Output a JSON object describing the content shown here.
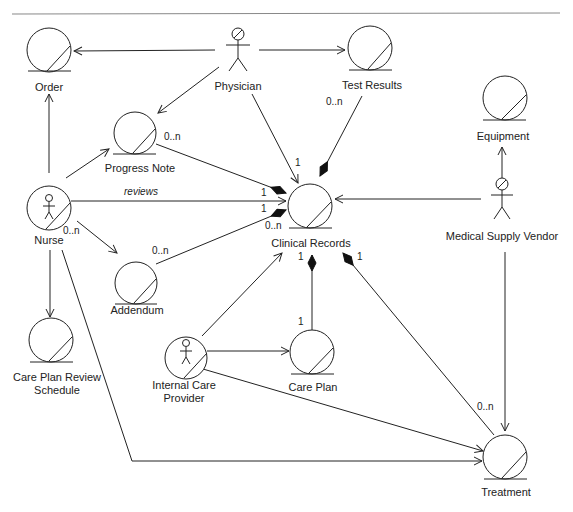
{
  "diagram": {
    "type": "UML entity/boundary collaboration diagram",
    "colors": {
      "stroke": "#222222",
      "background": "#ffffff",
      "fill_diamond": "#111111"
    },
    "nodes": {
      "order": {
        "label": "Order",
        "kind": "entity"
      },
      "physician": {
        "label": "Physician",
        "kind": "actor"
      },
      "test_results": {
        "label": "Test Results",
        "kind": "entity"
      },
      "progress_note": {
        "label": "Progress Note",
        "kind": "entity"
      },
      "equipment": {
        "label": "Equipment",
        "kind": "entity"
      },
      "nurse": {
        "label": "Nurse",
        "kind": "actor-entity"
      },
      "clinical_records": {
        "label": "Clinical Records",
        "kind": "entity"
      },
      "medical_supply_vendor": {
        "label": "Medical Supply Vendor",
        "kind": "actor"
      },
      "addendum": {
        "label": "Addendum",
        "kind": "entity"
      },
      "care_plan_review_schedule": {
        "label": "Care Plan Review\nSchedule",
        "kind": "entity"
      },
      "internal_care_provider": {
        "label": "Internal Care\nProvider",
        "kind": "actor-entity"
      },
      "care_plan": {
        "label": "Care Plan",
        "kind": "entity"
      },
      "treatment": {
        "label": "Treatment",
        "kind": "entity"
      }
    },
    "edges": [
      {
        "from": "Physician",
        "to": "Order",
        "type": "navigable association"
      },
      {
        "from": "Physician",
        "to": "Test Results",
        "type": "navigable association"
      },
      {
        "from": "Physician",
        "to": "Progress Note",
        "type": "navigable association"
      },
      {
        "from": "Physician",
        "to": "Clinical Records",
        "type": "navigable association",
        "mult_to": "1"
      },
      {
        "from": "Test Results",
        "to": "Clinical Records",
        "type": "composition",
        "mult_from": "0..n"
      },
      {
        "from": "Nurse",
        "to": "Order",
        "type": "navigable association"
      },
      {
        "from": "Nurse",
        "to": "Progress Note",
        "type": "navigable association"
      },
      {
        "from": "Nurse",
        "to": "Clinical Records",
        "type": "navigable association",
        "label": "reviews"
      },
      {
        "from": "Nurse",
        "to": "Addendum",
        "type": "navigable association",
        "mult_from": "0..n"
      },
      {
        "from": "Nurse",
        "to": "Care Plan Review Schedule",
        "type": "navigable association"
      },
      {
        "from": "Nurse",
        "to": "Treatment",
        "type": "navigable association"
      },
      {
        "from": "Progress Note",
        "to": "Clinical Records",
        "type": "composition",
        "mult_from": "0..n",
        "mult_to": "1"
      },
      {
        "from": "Addendum",
        "to": "Clinical Records",
        "type": "composition",
        "mult_from": "0..n",
        "mult_to": "1"
      },
      {
        "from": "Medical Supply Vendor",
        "to": "Clinical Records",
        "type": "navigable association"
      },
      {
        "from": "Medical Supply Vendor",
        "to": "Equipment",
        "type": "navigable association"
      },
      {
        "from": "Medical Supply Vendor",
        "to": "Treatment",
        "type": "navigable association"
      },
      {
        "from": "Internal Care Provider",
        "to": "Clinical Records",
        "type": "navigable association"
      },
      {
        "from": "Internal Care Provider",
        "to": "Care Plan",
        "type": "navigable association"
      },
      {
        "from": "Internal Care Provider",
        "to": "Treatment",
        "type": "navigable association"
      },
      {
        "from": "Care Plan",
        "to": "Clinical Records",
        "type": "composition",
        "mult_from": "1",
        "mult_to": "1"
      },
      {
        "from": "Treatment",
        "to": "Clinical Records",
        "type": "composition",
        "mult_from": "0..n",
        "mult_to": "1"
      }
    ],
    "multiplicities": {
      "progress_note_from": "0..n",
      "progress_note_to": "1",
      "reviews_to": "1",
      "addendum_to": "0..n",
      "addendum_cr": "0..n",
      "physician_cr": "1",
      "test_results_from": "0..n",
      "nurse_addendum": "0..n",
      "care_plan_cr": "1",
      "care_plan_from": "1",
      "treatment_cr": "1",
      "treatment_from": "0..n"
    },
    "association_labels": {
      "reviews": "reviews"
    }
  }
}
